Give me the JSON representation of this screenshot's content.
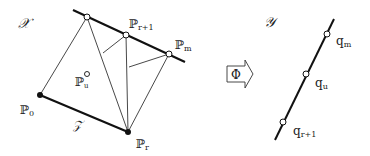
{
  "left_panel": {
    "space_label": "𝒳",
    "subspace_label": "𝒵",
    "points": {
      "p0": {
        "label": "ℙ",
        "sub": "0"
      },
      "pr": {
        "label": "ℙ",
        "sub": "r"
      },
      "pr1": {
        "label": "ℙ",
        "sub": "r+1"
      },
      "pm": {
        "label": "ℙ",
        "sub": "m"
      },
      "pu": {
        "label": "ℙ",
        "sub": "u"
      }
    }
  },
  "mapping": {
    "label": "Φ"
  },
  "right_panel": {
    "space_label": "𝒴",
    "points": {
      "qm": {
        "label": "q",
        "sub": "m"
      },
      "qu": {
        "label": "q",
        "sub": "u"
      },
      "qr1": {
        "label": "q",
        "sub": "r+1"
      }
    }
  }
}
